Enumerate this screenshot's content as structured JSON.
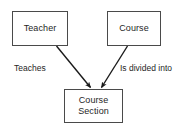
{
  "diagram": {
    "type": "entity-relationship",
    "background_color": "#ffffff",
    "line_color": "#1a1a1a",
    "box_border_color": "#4a4a4a",
    "text_color": "#262626",
    "entities": [
      {
        "id": "teacher",
        "label": "Teacher",
        "position": "top-left"
      },
      {
        "id": "course",
        "label": "Course",
        "position": "top-right"
      },
      {
        "id": "course_section",
        "label": "Course\nSection",
        "position": "bottom-center"
      }
    ],
    "relationships": [
      {
        "id": "teaches",
        "label": "Teaches",
        "from": "teacher",
        "to": "course_section",
        "arrowhead": "filled-triangle",
        "direction": "down-right"
      },
      {
        "id": "is_divided_into",
        "label": "Is divided into",
        "from": "course",
        "to": "course_section",
        "arrowhead": "filled-triangle",
        "direction": "down-left"
      }
    ]
  }
}
